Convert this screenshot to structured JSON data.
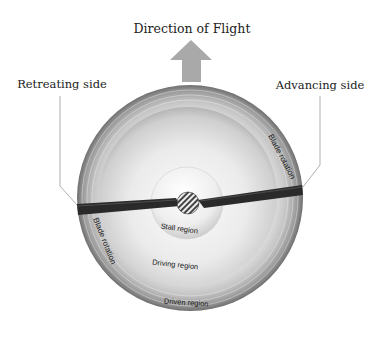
{
  "title": "Direction of Flight",
  "labels": {
    "retreating_side": "Retreating side",
    "advancing_side": "Advancing side",
    "blade_rotation_right": "Blade rotation",
    "blade_rotation_left": "Blade rotation",
    "stall_region": "Stall region",
    "driving_region": "Driving region",
    "driven_region": "Driven region"
  },
  "icons": {
    "direction_arrow": "arrow-up-icon",
    "rotor_hub": "hatched-hub-icon"
  },
  "colors": {
    "arrow": "#a9a9a9",
    "blade": "#2a2a2a",
    "disc_light": "#f2f2f2",
    "disc_dark": "#7a7a7a",
    "leader_line": "#9a9a9a",
    "text": "#222222"
  }
}
